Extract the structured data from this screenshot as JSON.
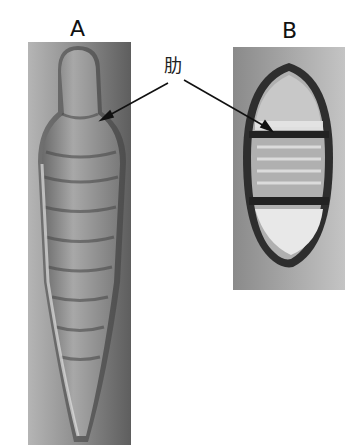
{
  "figure": {
    "panels": [
      {
        "id": "A",
        "label": "A",
        "description": "Elongated diatom frustule, club-shaped, with transverse ribs (light micrograph)"
      },
      {
        "id": "B",
        "label": "B",
        "description": "Elliptical diatom frustule with transverse ribs (light micrograph)"
      }
    ],
    "annotation": {
      "label": "肋",
      "meaning": "rib",
      "arrow_count": 2
    }
  },
  "colors": {
    "background": "#ffffff",
    "micrograph_bg": "#9a9a9a",
    "cell_dark": "#3a3a3a",
    "cell_light": "#d8d8d8",
    "arrow": "#111111"
  }
}
